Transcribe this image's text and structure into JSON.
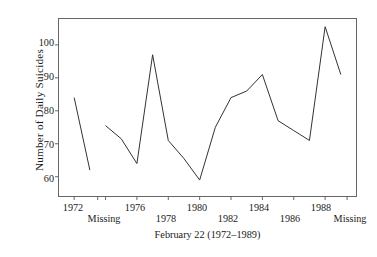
{
  "chart_data": {
    "type": "line",
    "title": "",
    "xlabel": "February 22 (1972–1989)",
    "ylabel": "Number of Daily Suicides",
    "xlim": [
      1971,
      1990
    ],
    "ylim": [
      54,
      108
    ],
    "grid": false,
    "legend": null,
    "x_tick_values": [
      1972,
      1974,
      1976,
      1978,
      1980,
      1982,
      1984,
      1986,
      1988
    ],
    "x_tick_labels": [
      "1972",
      "1974",
      "1976",
      "1978",
      "1980",
      "1982",
      "1984",
      "1986",
      "1988"
    ],
    "x_extra_labels": [
      {
        "text": "Missing",
        "value": 1973.5
      },
      {
        "text": "Missing",
        "value": 1989.4
      }
    ],
    "y_tick_values": [
      60,
      70,
      80,
      90,
      100
    ],
    "y_tick_labels": [
      "60",
      "70",
      "80",
      "90",
      "100"
    ],
    "line_color": "#333333",
    "series": [
      {
        "name": "Number of Daily Suicides",
        "x": [
          1972,
          1973
        ],
        "values": [
          84,
          62
        ]
      },
      {
        "name": "Number of Daily Suicides",
        "x": [
          1974,
          1975,
          1976,
          1977,
          1978,
          1979,
          1980,
          1981,
          1982,
          1983,
          1984,
          1985,
          1986,
          1987,
          1988,
          1989
        ],
        "values": [
          75.5,
          71.5,
          64,
          97,
          71,
          65.5,
          59,
          75,
          84,
          86,
          91,
          77,
          74,
          71,
          105.5,
          91
        ]
      }
    ]
  }
}
